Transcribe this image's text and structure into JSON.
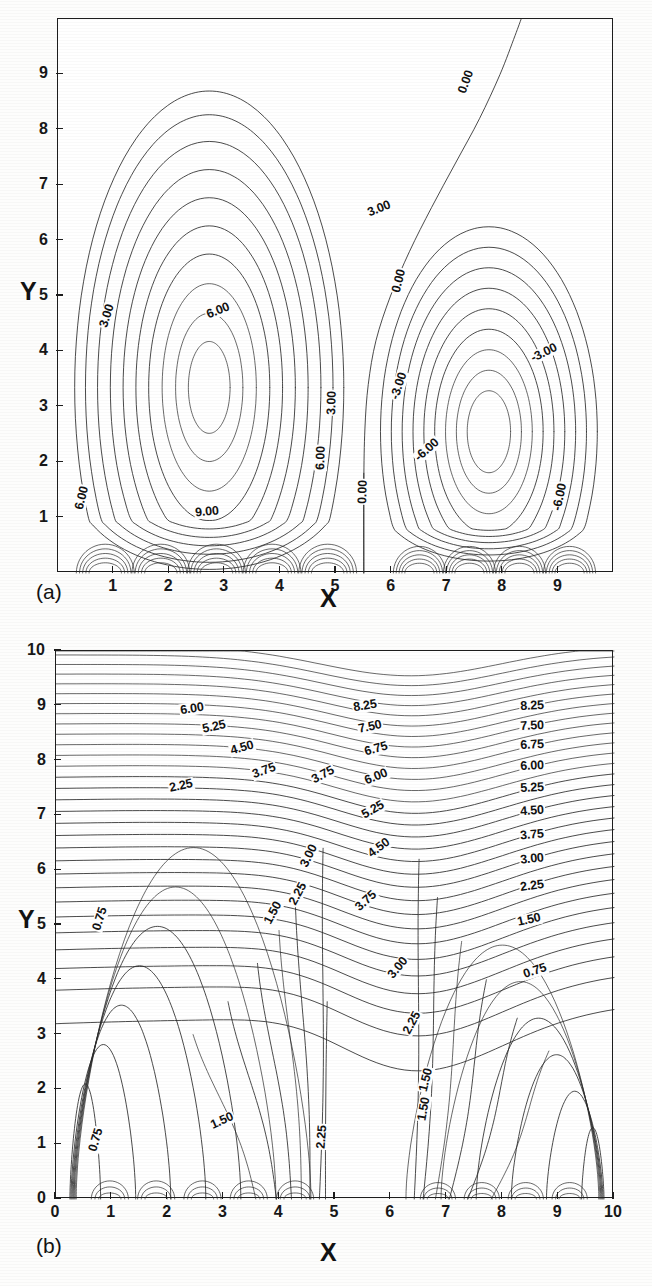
{
  "figure": {
    "background_color": "#ffffff",
    "line_color": "#2a2a2a",
    "text_color": "#121212"
  },
  "panel_a": {
    "tag": "(a)",
    "xlabel": "X",
    "ylabel": "Y",
    "xticks": [
      "1",
      "2",
      "3",
      "4",
      "5",
      "6",
      "7",
      "8",
      "9"
    ],
    "yticks": [
      "1",
      "2",
      "3",
      "4",
      "5",
      "6",
      "7",
      "8",
      "9"
    ],
    "contour_labels": [
      {
        "text": "3.00",
        "x": 0.58,
        "y": 6.55,
        "rot": -22
      },
      {
        "text": "3.00",
        "x": 0.09,
        "y": 4.62,
        "rot": -72
      },
      {
        "text": "6.00",
        "x": 0.29,
        "y": 4.72,
        "rot": -22
      },
      {
        "text": "6.00",
        "x": 0.045,
        "y": 1.33,
        "rot": -76
      },
      {
        "text": "9.00",
        "x": 0.27,
        "y": 1.08,
        "rot": -5
      },
      {
        "text": "3.00",
        "x": 0.495,
        "y": 3.05,
        "rot": -88
      },
      {
        "text": "6.00",
        "x": 0.475,
        "y": 2.05,
        "rot": -88
      },
      {
        "text": "0.00",
        "x": 0.55,
        "y": 1.45,
        "rot": -88
      },
      {
        "text": "0.00",
        "x": 0.735,
        "y": 8.85,
        "rot": -70
      },
      {
        "text": "0.00",
        "x": 0.615,
        "y": 5.25,
        "rot": -76
      },
      {
        "text": "-3.00",
        "x": 0.615,
        "y": 3.35,
        "rot": -72
      },
      {
        "text": "-3.00",
        "x": 0.875,
        "y": 3.95,
        "rot": -26
      },
      {
        "text": "-6.00",
        "x": 0.665,
        "y": 2.2,
        "rot": -42
      },
      {
        "text": "-6.00",
        "x": 0.905,
        "y": 1.35,
        "rot": -78
      }
    ]
  },
  "panel_b": {
    "tag": "(b)",
    "xlabel": "X",
    "ylabel": "Y",
    "xticks": [
      "0",
      "1",
      "2",
      "3",
      "4",
      "5",
      "6",
      "7",
      "8",
      "9",
      "10"
    ],
    "yticks": [
      "0",
      "1",
      "2",
      "3",
      "4",
      "5",
      "6",
      "7",
      "8",
      "9",
      "10"
    ],
    "contour_labels": [
      {
        "text": "6.00",
        "x": 0.245,
        "y": 8.92,
        "rot": -9
      },
      {
        "text": "5.25",
        "x": 0.285,
        "y": 8.6,
        "rot": -12
      },
      {
        "text": "4.50",
        "x": 0.335,
        "y": 8.22,
        "rot": -16
      },
      {
        "text": "3.75",
        "x": 0.375,
        "y": 7.8,
        "rot": -20
      },
      {
        "text": "2.25",
        "x": 0.225,
        "y": 7.52,
        "rot": -12
      },
      {
        "text": "8.25",
        "x": 0.555,
        "y": 8.98,
        "rot": -9
      },
      {
        "text": "7.50",
        "x": 0.565,
        "y": 8.6,
        "rot": -12
      },
      {
        "text": "6.75",
        "x": 0.575,
        "y": 8.2,
        "rot": -16
      },
      {
        "text": "6.00",
        "x": 0.575,
        "y": 7.68,
        "rot": -22
      },
      {
        "text": "5.25",
        "x": 0.57,
        "y": 7.08,
        "rot": -30
      },
      {
        "text": "4.50",
        "x": 0.58,
        "y": 6.38,
        "rot": -36
      },
      {
        "text": "3.75",
        "x": 0.558,
        "y": 5.42,
        "rot": -42
      },
      {
        "text": "3.00",
        "x": 0.615,
        "y": 4.2,
        "rot": -50
      },
      {
        "text": "2.25",
        "x": 0.64,
        "y": 3.2,
        "rot": -62
      },
      {
        "text": "1.50",
        "x": 0.665,
        "y": 2.15,
        "rot": -76
      },
      {
        "text": "3.00",
        "x": 0.455,
        "y": 6.25,
        "rot": -64
      },
      {
        "text": "2.25",
        "x": 0.435,
        "y": 5.55,
        "rot": -62
      },
      {
        "text": "1.50",
        "x": 0.39,
        "y": 5.2,
        "rot": -62
      },
      {
        "text": "3.75",
        "x": 0.48,
        "y": 7.72,
        "rot": -28
      },
      {
        "text": "8.25",
        "x": 0.855,
        "y": 8.98,
        "rot": -3
      },
      {
        "text": "7.50",
        "x": 0.855,
        "y": 8.62,
        "rot": -3
      },
      {
        "text": "6.75",
        "x": 0.855,
        "y": 8.26,
        "rot": -3
      },
      {
        "text": "6.00",
        "x": 0.855,
        "y": 7.88,
        "rot": -3
      },
      {
        "text": "5.25",
        "x": 0.855,
        "y": 7.48,
        "rot": -3
      },
      {
        "text": "4.50",
        "x": 0.855,
        "y": 7.06,
        "rot": -4
      },
      {
        "text": "3.75",
        "x": 0.855,
        "y": 6.62,
        "rot": -5
      },
      {
        "text": "3.00",
        "x": 0.855,
        "y": 6.18,
        "rot": -6
      },
      {
        "text": "2.25",
        "x": 0.855,
        "y": 5.7,
        "rot": -8
      },
      {
        "text": "1.50",
        "x": 0.85,
        "y": 5.08,
        "rot": -12
      },
      {
        "text": "0.75",
        "x": 0.86,
        "y": 4.15,
        "rot": -18
      },
      {
        "text": "0.75",
        "x": 0.08,
        "y": 5.1,
        "rot": -72
      },
      {
        "text": "0.75",
        "x": 0.073,
        "y": 1.05,
        "rot": -74
      },
      {
        "text": "1.50",
        "x": 0.3,
        "y": 1.4,
        "rot": -24
      },
      {
        "text": "2.25",
        "x": 0.478,
        "y": 1.12,
        "rot": -86
      },
      {
        "text": "1.50",
        "x": 0.662,
        "y": 1.62,
        "rot": -80
      }
    ]
  },
  "chart_data": [
    {
      "type": "line",
      "subtype": "contour",
      "title": "(a)",
      "xlabel": "X",
      "ylabel": "Y",
      "xlim": [
        0,
        10
      ],
      "ylim": [
        0,
        10
      ],
      "grid": false,
      "legend": "none",
      "contour_interval": 1.5,
      "labeled_levels": [
        9.0,
        6.0,
        3.0,
        0.0,
        -3.0,
        -6.0
      ],
      "description": "Streamfunction contours: two counter-rotating cells. Left cell positive (peak above 9.00 near x=2.8, y=2.2), right cell negative (trough below -6.00 near x=7.7, y=1.7), separated by the 0.00 contour running from x=5.5 at the bottom to x=8.3 at the top.",
      "series": [
        {
          "name": "left-cell-levels",
          "values": [
            0.0,
            1.5,
            3.0,
            4.5,
            6.0,
            7.5,
            9.0,
            10.5
          ]
        },
        {
          "name": "right-cell-levels",
          "values": [
            0.0,
            -1.5,
            -3.0,
            -4.5,
            -6.0,
            -7.5
          ]
        }
      ]
    },
    {
      "type": "line",
      "subtype": "contour",
      "title": "(b)",
      "xlabel": "X",
      "ylabel": "Y",
      "xlim": [
        0,
        10
      ],
      "ylim": [
        0,
        10
      ],
      "grid": false,
      "legend": "none",
      "contour_interval": 0.75,
      "labeled_levels": [
        0.75,
        1.5,
        2.25,
        3.0,
        3.75,
        4.5,
        5.25,
        6.0,
        6.75,
        7.5,
        8.25
      ],
      "description": "Isotherm contours: dense stratification near the top wall (y=8 to 10), plumes rising near x=4.7 and x=6.4, and cool low-gradient pockets in the lower-left and lower-right corners.",
      "series": [
        {
          "name": "levels",
          "values": [
            0.75,
            1.5,
            2.25,
            3.0,
            3.75,
            4.5,
            5.25,
            6.0,
            6.75,
            7.5,
            8.25,
            9.0,
            9.75
          ]
        }
      ]
    }
  ]
}
